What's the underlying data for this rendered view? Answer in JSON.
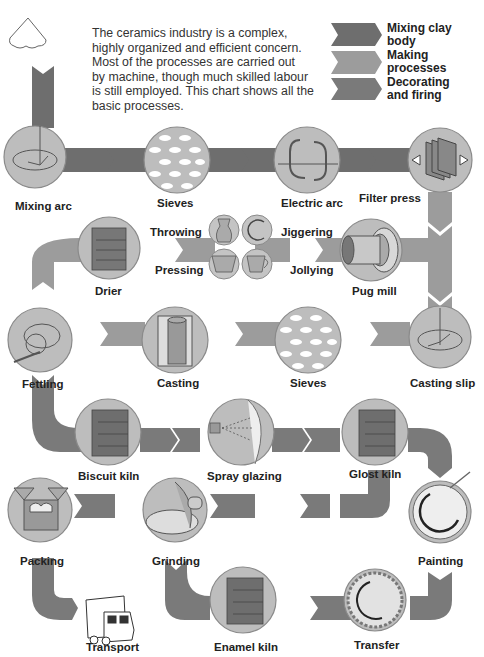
{
  "intro": {
    "lines": [
      "The ceramics industry is a complex,",
      "highly organized and efficient concern.",
      "Most of the processes are carried out",
      "by machine, though much skilled labour",
      "is still employed. This chart shows all the",
      "basic processes."
    ]
  },
  "legend": {
    "items": [
      {
        "label_1": "Mixing clay",
        "label_2": "body",
        "color": "#6e6e6e"
      },
      {
        "label_1": "Making",
        "label_2": "processes",
        "color": "#9c9c9c"
      },
      {
        "label_1": "Decorating",
        "label_2": "and firing",
        "color": "#7a7a7a"
      }
    ]
  },
  "colors": {
    "mixing": "#6e6e6e",
    "making": "#9c9c9c",
    "decorating": "#7a7a7a",
    "circle_fill": "#b8b8b8",
    "circle_edge": "#8a8a8a"
  },
  "steps": {
    "mixing_arc": "Mixing arc",
    "sieves_1": "Sieves",
    "electric_arc": "Electric arc",
    "filter_press": "Filter press",
    "pug_mill": "Pug mill",
    "throwing": "Throwing",
    "jiggering": "Jiggering",
    "pressing": "Pressing",
    "jollying": "Jollying",
    "drier": "Drier",
    "casting_slip": "Casting slip",
    "sieves_2": "Sieves",
    "casting": "Casting",
    "fettling": "Fettling",
    "biscuit_kiln": "Biscuit kiln",
    "spray_glazing": "Spray glazing",
    "glost_kiln": "Glost kiln",
    "painting": "Painting",
    "transfer": "Transfer",
    "enamel_kiln": "Enamel kiln",
    "grinding": "Grinding",
    "packing": "Packing",
    "transport": "Transport"
  }
}
